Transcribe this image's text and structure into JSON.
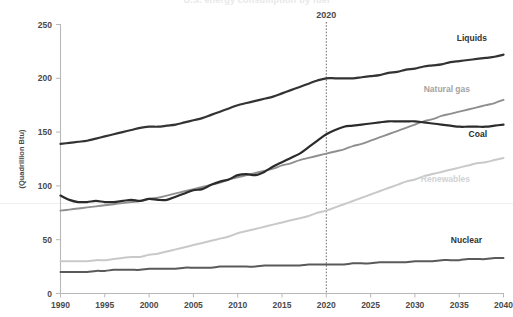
{
  "chart_data": {
    "type": "line",
    "title": "U.S. energy consumption by fuel",
    "xlabel": "",
    "ylabel": "(Quadrillion Btu)",
    "xlim": [
      1990,
      2040
    ],
    "ylim": [
      0,
      250
    ],
    "xticks": [
      1990,
      1995,
      2000,
      2005,
      2010,
      2015,
      2020,
      2025,
      2030,
      2035,
      2040
    ],
    "yticks": [
      0,
      50,
      100,
      150,
      200,
      250
    ],
    "grid": false,
    "legend_position": "inline-right",
    "annotations": [
      {
        "label": "2020",
        "x": 2020,
        "type": "vertical-dashed-line"
      }
    ],
    "x": [
      1990,
      1991,
      1992,
      1993,
      1994,
      1995,
      1996,
      1997,
      1998,
      1999,
      2000,
      2001,
      2002,
      2003,
      2004,
      2005,
      2006,
      2007,
      2008,
      2009,
      2010,
      2011,
      2012,
      2013,
      2014,
      2015,
      2016,
      2017,
      2018,
      2019,
      2020,
      2021,
      2022,
      2023,
      2024,
      2025,
      2026,
      2027,
      2028,
      2029,
      2030,
      2031,
      2032,
      2033,
      2034,
      2035,
      2036,
      2037,
      2038,
      2039,
      2040
    ],
    "series": [
      {
        "name": "Liquids",
        "color": "#333333",
        "label_color": "#333333",
        "values": [
          139,
          140,
          141,
          142,
          144,
          146,
          148,
          150,
          152,
          154,
          155,
          155,
          156,
          157,
          159,
          161,
          163,
          166,
          169,
          172,
          175,
          177,
          179,
          181,
          183,
          186,
          189,
          192,
          195,
          198,
          200,
          200,
          200,
          200,
          201,
          202,
          203,
          205,
          206,
          208,
          209,
          211,
          212,
          213,
          215,
          216,
          217,
          218,
          219,
          220,
          222
        ]
      },
      {
        "name": "Natural gas",
        "color": "#8f8f8f",
        "label_color": "#a3a3a3",
        "values": [
          77,
          78,
          79,
          80,
          81,
          82,
          83,
          84,
          85,
          86,
          88,
          89,
          91,
          93,
          95,
          97,
          99,
          101,
          103,
          106,
          108,
          110,
          112,
          114,
          116,
          119,
          121,
          124,
          126,
          128,
          130,
          132,
          134,
          137,
          139,
          142,
          145,
          148,
          151,
          154,
          157,
          160,
          162,
          165,
          167,
          169,
          171,
          173,
          175,
          177,
          180
        ]
      },
      {
        "name": "Coal",
        "color": "#2b2b2b",
        "label_color": "#2b2b2b",
        "values": [
          91,
          87,
          85,
          85,
          86,
          85,
          85,
          86,
          87,
          86,
          88,
          87,
          87,
          90,
          93,
          96,
          97,
          101,
          104,
          106,
          110,
          111,
          110,
          113,
          118,
          122,
          126,
          130,
          136,
          142,
          148,
          152,
          155,
          156,
          157,
          158,
          159,
          160,
          160,
          160,
          160,
          159,
          158,
          157,
          156,
          155,
          155,
          155,
          155,
          156,
          157
        ]
      },
      {
        "name": "Renewables",
        "color": "#c9c9c9",
        "label_color": "#d2d2d2",
        "values": [
          30,
          30,
          30,
          30,
          31,
          31,
          32,
          33,
          34,
          34,
          36,
          37,
          39,
          41,
          43,
          45,
          47,
          49,
          51,
          53,
          56,
          58,
          60,
          62,
          64,
          66,
          68,
          70,
          72,
          75,
          77,
          80,
          83,
          86,
          89,
          92,
          95,
          98,
          101,
          104,
          106,
          109,
          111,
          113,
          115,
          117,
          119,
          121,
          122,
          124,
          126
        ]
      },
      {
        "name": "Nuclear",
        "color": "#5a5a5a",
        "label_color": "#333333",
        "values": [
          20,
          20,
          20,
          20,
          21,
          21,
          22,
          22,
          22,
          22,
          23,
          23,
          23,
          23,
          24,
          24,
          24,
          24,
          25,
          25,
          25,
          25,
          25,
          26,
          26,
          26,
          26,
          26,
          27,
          27,
          27,
          27,
          27,
          28,
          28,
          28,
          29,
          29,
          29,
          29,
          30,
          30,
          30,
          31,
          31,
          31,
          32,
          32,
          32,
          33,
          33
        ]
      }
    ],
    "series_label_positions": [
      {
        "name": "Liquids",
        "x": 487,
        "y": 41
      },
      {
        "name": "Natural gas",
        "x": 470,
        "y": 92
      },
      {
        "name": "Coal",
        "x": 487,
        "y": 137
      },
      {
        "name": "Renewables",
        "x": 470,
        "y": 182
      },
      {
        "name": "Nuclear",
        "x": 482,
        "y": 243
      }
    ]
  }
}
